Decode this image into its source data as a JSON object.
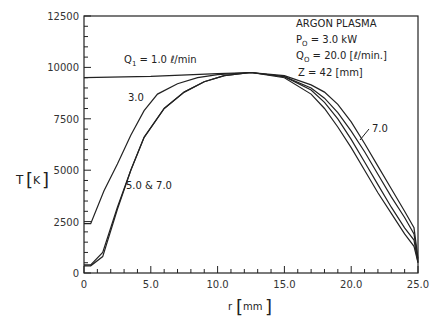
{
  "chart_data": {
    "type": "line",
    "title": "",
    "xlabel": "r [mm]",
    "ylabel": "T [K]",
    "xlim": [
      0,
      25
    ],
    "ylim": [
      0,
      12500
    ],
    "x_ticks": [
      "0",
      "5.0",
      "10.0",
      "15.0",
      "20.0",
      "25.0"
    ],
    "y_ticks": [
      "0",
      "2500",
      "5000",
      "7500",
      "10000",
      "12500"
    ],
    "grid": false,
    "legend_box": {
      "line1": "ARGON PLASMA",
      "line2_prefix": "P",
      "line2_sub": "O",
      "line2_rest": " = 3.0 kW",
      "line3_prefix": "Q",
      "line3_sub": "O",
      "line3_rest": " = 20.0 [ℓ/min.]",
      "line4": "Z = 42 [mm]"
    },
    "annotations": {
      "q1_prefix": "Q",
      "q1_sub": "1",
      "q1_rest": " = 1.0 ℓ/min",
      "label_3": "3.0",
      "label_5_7": "5.0 & 7.0",
      "label_7": "7.0"
    },
    "series": [
      {
        "name": "Q1 = 1.0 l/min",
        "x": [
          0,
          5,
          10,
          12.5,
          15,
          17,
          18,
          19,
          20,
          21,
          22,
          23,
          24,
          24.7,
          25
        ],
        "y": [
          9500,
          9560,
          9700,
          9750,
          9600,
          9150,
          8800,
          8200,
          7350,
          6300,
          5200,
          4100,
          3000,
          2200,
          700
        ]
      },
      {
        "name": "Q1 = 3.0 l/min",
        "x": [
          0,
          0.5,
          1.5,
          2.5,
          3.5,
          4.5,
          5.5,
          7,
          8.5,
          10,
          12.5,
          15,
          17,
          18,
          19,
          20,
          21,
          22,
          23,
          24,
          24.7,
          25
        ],
        "y": [
          2400,
          2400,
          4000,
          5300,
          6700,
          7900,
          8700,
          9200,
          9500,
          9650,
          9750,
          9550,
          9000,
          8500,
          7800,
          6900,
          5900,
          4800,
          3700,
          2700,
          1900,
          600
        ]
      },
      {
        "name": "Q1 = 5.0 l/min",
        "x": [
          0,
          0.5,
          1.4,
          2.5,
          3.5,
          4.5,
          6,
          7.5,
          9,
          10.5,
          12.5,
          15,
          17,
          18,
          19,
          20,
          21,
          22,
          23,
          24,
          24.7,
          25
        ],
        "y": [
          400,
          400,
          1000,
          3200,
          5000,
          6600,
          8000,
          8800,
          9300,
          9600,
          9750,
          9550,
          8900,
          8300,
          7500,
          6500,
          5400,
          4300,
          3200,
          2200,
          1600,
          500
        ]
      },
      {
        "name": "Q1 = 7.0 l/min",
        "x": [
          0,
          0.5,
          1.4,
          2.5,
          3.5,
          4.5,
          6,
          7.5,
          9,
          10.5,
          12.5,
          15,
          17,
          18,
          19,
          20,
          21,
          22,
          23,
          24,
          24.7,
          25
        ],
        "y": [
          350,
          350,
          800,
          3100,
          5000,
          6600,
          8000,
          8800,
          9300,
          9600,
          9750,
          9500,
          8700,
          8000,
          7100,
          6100,
          5000,
          3900,
          2900,
          1900,
          1300,
          500
        ]
      }
    ]
  }
}
